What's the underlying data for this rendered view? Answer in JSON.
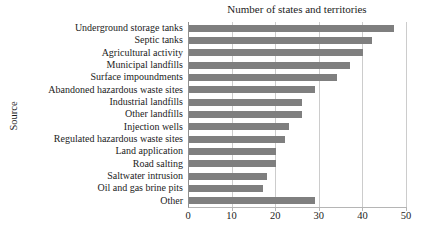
{
  "colors": {
    "bar": "#7f7f7f",
    "gridline": "#cccccc",
    "axis": "#8f8f8f",
    "text": "#1c1c1c",
    "background": "#ffffff"
  },
  "chart_data": {
    "type": "bar",
    "orientation": "horizontal",
    "title": "Number of states and territories",
    "ylabel": "Source",
    "xlabel": "",
    "categories": [
      "Underground storage tanks",
      "Septic tanks",
      "Agricultural activity",
      "Municipal landfills",
      "Surface impoundments",
      "Abandoned hazardous waste sites",
      "Industrial landfills",
      "Other landfills",
      "Injection wells",
      "Regulated hazardous waste sites",
      "Land application",
      "Road salting",
      "Saltwater intrusion",
      "Oil and gas brine pits",
      "Other"
    ],
    "values": [
      47,
      42,
      40,
      37,
      34,
      29,
      26,
      26,
      23,
      22,
      20,
      20,
      18,
      17,
      29
    ],
    "xlim": [
      0,
      50
    ],
    "xticks": [
      0,
      10,
      20,
      30,
      40,
      50
    ],
    "grid": "vertical-gridlines",
    "legend": "none"
  }
}
